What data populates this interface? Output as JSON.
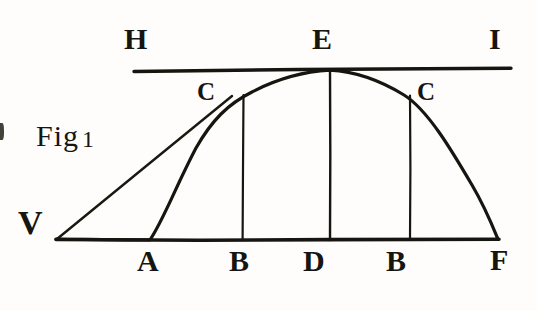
{
  "figure": {
    "caption_text": "Fig",
    "caption_number": "1",
    "ink_color": "#17150f",
    "paper_color": "#fefdfb"
  },
  "labels": {
    "tangent_left": "H",
    "tangent_right": "I",
    "apex": "E",
    "curve_left": "C",
    "curve_right": "C",
    "origin": "V",
    "base_a": "A",
    "base_b_left": "B",
    "base_d": "D",
    "base_b_right": "B",
    "base_f": "F"
  },
  "geometry": {
    "tangent_line": {
      "name": "HI",
      "x1": 134,
      "y1": 71,
      "x2": 511,
      "y2": 68
    },
    "base_line": {
      "name": "VF",
      "x1": 55,
      "y1": 240,
      "x2": 499,
      "y2": 239
    },
    "chord": {
      "name": "V-to-C",
      "x1": 56,
      "y1": 239,
      "x2": 232,
      "y2": 96
    },
    "curve": {
      "name": "trajectory-VCEcF",
      "points": "56,239 150,240 190,140 243,97 290,77 330,70 372,77 410,97 455,150 498,239"
    },
    "ordinates": [
      {
        "name": "ordinate-B-left",
        "x": 243,
        "y_top": 97,
        "y_bottom": 240
      },
      {
        "name": "ordinate-D-center",
        "x": 330,
        "y_top": 70,
        "y_bottom": 240
      },
      {
        "name": "ordinate-B-right",
        "x": 410,
        "y_top": 97,
        "y_bottom": 240
      }
    ]
  },
  "label_positions": {
    "H": {
      "x": 124,
      "y": 24
    },
    "E": {
      "x": 312,
      "y": 24
    },
    "I": {
      "x": 489,
      "y": 24
    },
    "C_left": {
      "x": 196,
      "y": 78
    },
    "C_right": {
      "x": 416,
      "y": 78
    },
    "V": {
      "x": 18,
      "y": 206
    },
    "A": {
      "x": 137,
      "y": 246
    },
    "B_left": {
      "x": 229,
      "y": 246
    },
    "D": {
      "x": 303,
      "y": 246
    },
    "B_right": {
      "x": 385,
      "y": 246
    },
    "F": {
      "x": 490,
      "y": 245
    },
    "caption": {
      "x": 36,
      "y": 121
    }
  }
}
